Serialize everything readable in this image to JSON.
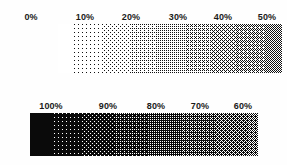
{
  "figure": {
    "background_color": "#fefefe",
    "ink_color": "#111111",
    "paper_color": "#ffffff",
    "width_px": 287,
    "height_px": 165
  },
  "bands": [
    {
      "id": "top",
      "name": "light-to-mid-tones",
      "polarity": "black-dots-on-white",
      "base_color": "#ffffff",
      "dot_color": "#111111",
      "geometry": {
        "x": 58,
        "y": 24,
        "width": 224,
        "height": 49
      },
      "density_start_pct": 0,
      "density_end_pct": 50,
      "cell_px": 4,
      "labels": [
        {
          "text": "0%",
          "value": 0,
          "x": 31
        },
        {
          "text": "10%",
          "value": 10,
          "x": 85
        },
        {
          "text": "20%",
          "value": 20,
          "x": 131
        },
        {
          "text": "30%",
          "value": 30,
          "x": 178
        },
        {
          "text": "40%",
          "value": 40,
          "x": 223
        },
        {
          "text": "50%",
          "value": 50,
          "x": 267
        }
      ],
      "label_y": 12
    },
    {
      "id": "bottom",
      "name": "mid-to-dark-tones",
      "polarity": "white-dots-on-black",
      "base_color": "#0a0a0a",
      "dot_color": "#ffffff",
      "geometry": {
        "x": 30,
        "y": 30,
        "width": 228,
        "height": 43
      },
      "density_start_pct": 100,
      "density_end_pct": 58,
      "cell_px": 4,
      "labels": [
        {
          "text": "100%",
          "value": 100,
          "x": 51
        },
        {
          "text": "90%",
          "value": 90,
          "x": 108
        },
        {
          "text": "80%",
          "value": 80,
          "x": 156
        },
        {
          "text": "70%",
          "value": 70,
          "x": 200
        },
        {
          "text": "60%",
          "value": 60,
          "x": 243
        }
      ],
      "label_y": 18
    }
  ],
  "chart_data": {
    "type": "heatmap",
    "xlabel": "",
    "ylabel": "",
    "grid": false,
    "legend_position": "none",
    "series": [
      {
        "name": "top-band-0-to-50-percent",
        "polarity": "black-dots-on-white",
        "categories": [
          "0%",
          "10%",
          "20%",
          "30%",
          "40%",
          "50%"
        ],
        "values": [
          0,
          10,
          20,
          30,
          40,
          50
        ]
      },
      {
        "name": "bottom-band-100-to-60-percent",
        "polarity": "white-dots-on-black",
        "categories": [
          "100%",
          "90%",
          "80%",
          "70%",
          "60%"
        ],
        "values": [
          100,
          90,
          80,
          70,
          60
        ]
      }
    ]
  }
}
